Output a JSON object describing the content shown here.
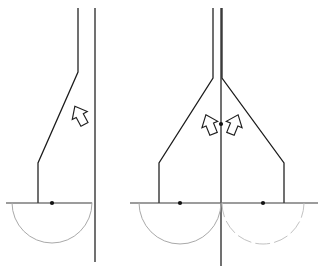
{
  "figure": {
    "canvas": {
      "width": 323,
      "height": 275,
      "background": "#ffffff"
    },
    "colors": {
      "line": "#1c1c1c",
      "baseline": "#3a3a3a",
      "arc": "#a9a9a9",
      "arc_faint": "#c2c2c2",
      "dot": "#111111",
      "arrow_fill": "#ffffff",
      "arrow_stroke": "#1f1f1f"
    },
    "panels": [
      {
        "id": "left-panel",
        "name": "asymmetric-flow-panel",
        "baseline": {
          "y": 203,
          "x_start": 6,
          "x_end": 92
        },
        "vertical_lines": [
          {
            "name": "slanted-wall",
            "x_top": 78,
            "y_top": 8,
            "bend_y": 72,
            "foot_x": 38,
            "foot_y": 163,
            "base_y": 203
          },
          {
            "name": "straight-wall",
            "x": 95,
            "y_top": 8,
            "y_bottom": 262
          }
        ],
        "node_dot": {
          "x": 52,
          "y": 203,
          "r": 2.1
        },
        "arc": {
          "cx": 52,
          "cy": 203,
          "r": 40,
          "style": "solid"
        },
        "arrows": [
          {
            "name": "flow-arrow-up-left",
            "x": 80,
            "y": 116,
            "rotation": -28,
            "scale": 1.0
          }
        ]
      },
      {
        "id": "right-panel",
        "name": "symmetric-flow-panel",
        "baseline": {
          "y": 203,
          "x_start": 130,
          "x_end": 318
        },
        "center_line": {
          "x": 221,
          "y_top": 8,
          "y_bottom": 266
        },
        "vertical_lines": [
          {
            "name": "left-inner-wall",
            "x_top": 213,
            "y_top": 8,
            "bend_y": 78
          },
          {
            "name": "right-inner-wall",
            "x_top": 222,
            "y_top": 8,
            "bend_y": 78
          }
        ],
        "branches": [
          {
            "name": "left-branch",
            "apex_x": 213,
            "apex_y": 78,
            "foot_x": 159,
            "foot_y": 163,
            "base_y": 203
          },
          {
            "name": "right-branch",
            "apex_x": 222,
            "apex_y": 78,
            "foot_x": 284,
            "foot_y": 163,
            "base_y": 203
          }
        ],
        "node_dots": [
          {
            "x": 180,
            "y": 203,
            "r": 2.1
          },
          {
            "x": 263,
            "y": 203,
            "r": 2.1
          }
        ],
        "center_dot": {
          "x": 221,
          "y": 124,
          "r": 2.1
        },
        "arcs": [
          {
            "name": "left-arc",
            "cx": 180,
            "cy": 203,
            "r": 41,
            "style": "solid"
          },
          {
            "name": "right-arc",
            "cx": 263,
            "cy": 203,
            "r": 41,
            "style": "dashed"
          }
        ],
        "arrows": [
          {
            "name": "flow-arrow-up-left",
            "x": 210,
            "y": 125,
            "rotation": -22,
            "scale": 1.0
          },
          {
            "name": "flow-arrow-up-right",
            "x": 234,
            "y": 125,
            "rotation": 22,
            "scale": 1.0
          }
        ]
      }
    ],
    "legend": {
      "arrow_meaning": "flow direction",
      "dot_meaning": "source point",
      "arc_meaning": "influence boundary"
    }
  }
}
